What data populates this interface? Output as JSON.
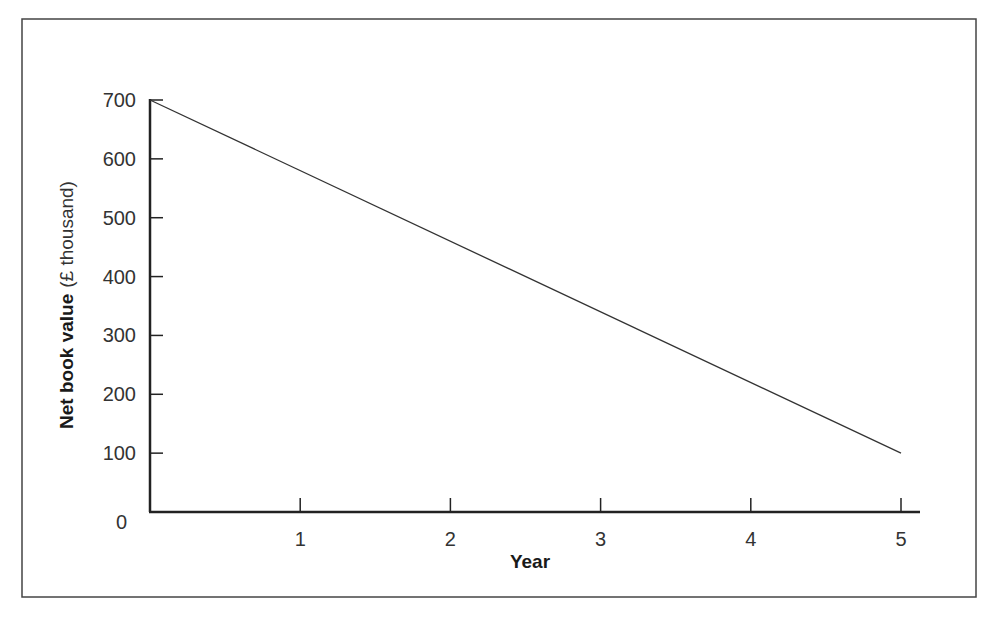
{
  "chart_data": {
    "type": "line",
    "title": "",
    "xlabel": "Year",
    "ylabel": "Net book value",
    "ylabel_unit": "(£ thousand)",
    "x": [
      0,
      5
    ],
    "series": [
      {
        "name": "Net book value",
        "values": [
          700,
          100
        ]
      }
    ],
    "xticks": [
      1,
      2,
      3,
      4,
      5
    ],
    "yticks": [
      0,
      100,
      200,
      300,
      400,
      500,
      600,
      700
    ],
    "xlim": [
      0,
      5.1
    ],
    "ylim": [
      0,
      700
    ],
    "grid": false,
    "legend": null,
    "colors": {
      "line": "#333333",
      "axis": "#222222",
      "frame": "#444444"
    }
  }
}
